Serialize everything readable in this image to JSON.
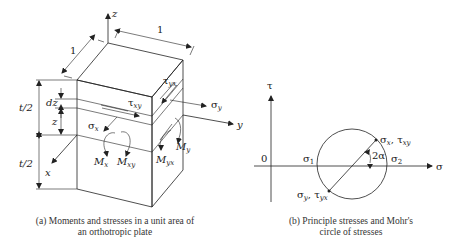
{
  "figure_a": {
    "caption_line1": "(a) Moments and stresses in a unit area of",
    "caption_line2": "an orthotropic plate",
    "axes": {
      "z": "z",
      "y": "y",
      "x": "x"
    },
    "dimensions": {
      "width_top": "1",
      "depth_left": "1",
      "half_thickness_upper": "t/2",
      "half_thickness_lower": "t/2",
      "layer": "dz",
      "height": "z"
    },
    "stresses": {
      "sigma_x": "σ",
      "sigma_x_sub": "x",
      "sigma_y": "σ",
      "sigma_y_sub": "y",
      "tau_xy": "τ",
      "tau_xy_sub": "xy",
      "tau_yx": "τ",
      "tau_yx_sub": "yx"
    },
    "moments": {
      "Mx": "M",
      "Mx_sub": "x",
      "Mxy": "M",
      "Mxy_sub": "xy",
      "My": "M",
      "My_sub": "y",
      "Myx": "M",
      "Myx_sub": "yx"
    }
  },
  "figure_b": {
    "caption_line1": "(b) Principle stresses and Mohr's",
    "caption_line2": "circle of stresses",
    "axis_tau": "τ",
    "axis_sigma": "σ",
    "origin": "0",
    "sigma1": "σ",
    "sigma1_sub": "1",
    "sigma2": "σ",
    "sigma2_sub": "2",
    "angle": "2α",
    "point_upper": "σ",
    "point_upper_sub1": "x",
    "point_upper_sep": ", τ",
    "point_upper_sub2": "xy",
    "point_lower": "σ",
    "point_lower_sub1": "y",
    "point_lower_sep": ", τ",
    "point_lower_sub2": "yx"
  }
}
